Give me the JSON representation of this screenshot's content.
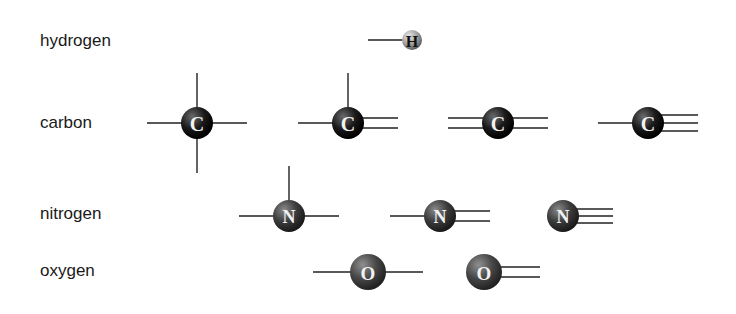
{
  "rows": [
    {
      "label": "hydrogen",
      "symbol": "H",
      "color": "#a8a8a8",
      "atoms": [
        {
          "bonds": "single-left"
        }
      ]
    },
    {
      "label": "carbon",
      "symbol": "C",
      "color": "#1c1c1c",
      "atoms": [
        {
          "bonds": "four-single"
        },
        {
          "bonds": "single-single-double"
        },
        {
          "bonds": "double-double"
        },
        {
          "bonds": "single-triple"
        }
      ]
    },
    {
      "label": "nitrogen",
      "symbol": "N",
      "color": "#3e3e3e",
      "atoms": [
        {
          "bonds": "three-single"
        },
        {
          "bonds": "single-double"
        },
        {
          "bonds": "triple"
        }
      ]
    },
    {
      "label": "oxygen",
      "symbol": "O",
      "color": "#4a4a4a",
      "atoms": [
        {
          "bonds": "two-single"
        },
        {
          "bonds": "double"
        }
      ]
    }
  ]
}
